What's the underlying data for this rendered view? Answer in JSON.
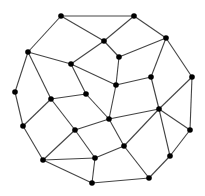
{
  "diagram": {
    "type": "undirected-graph",
    "style": {
      "background": "#ffffff",
      "node_color": "#000000",
      "edge_color": "#444444"
    },
    "nodes": [
      {
        "id": "A",
        "x": 61,
        "y": 16
      },
      {
        "id": "B",
        "x": 134,
        "y": 16
      },
      {
        "id": "C",
        "x": 104,
        "y": 41
      },
      {
        "id": "D",
        "x": 166,
        "y": 38
      },
      {
        "id": "E",
        "x": 28,
        "y": 52
      },
      {
        "id": "F",
        "x": 71,
        "y": 64
      },
      {
        "id": "G",
        "x": 119,
        "y": 57
      },
      {
        "id": "H",
        "x": 151,
        "y": 77
      },
      {
        "id": "I",
        "x": 192,
        "y": 77
      },
      {
        "id": "J",
        "x": 116,
        "y": 85
      },
      {
        "id": "K",
        "x": 15,
        "y": 92
      },
      {
        "id": "L",
        "x": 51,
        "y": 99
      },
      {
        "id": "M",
        "x": 86,
        "y": 94
      },
      {
        "id": "N",
        "x": 159,
        "y": 109
      },
      {
        "id": "O",
        "x": 109,
        "y": 119
      },
      {
        "id": "P",
        "x": 23,
        "y": 126
      },
      {
        "id": "Q",
        "x": 75,
        "y": 130
      },
      {
        "id": "R",
        "x": 190,
        "y": 130
      },
      {
        "id": "S",
        "x": 124,
        "y": 146
      },
      {
        "id": "T",
        "x": 170,
        "y": 156
      },
      {
        "id": "U",
        "x": 43,
        "y": 160
      },
      {
        "id": "V",
        "x": 95,
        "y": 158
      },
      {
        "id": "W",
        "x": 149,
        "y": 178
      },
      {
        "id": "X",
        "x": 92,
        "y": 183
      }
    ],
    "edges": [
      [
        "A",
        "B"
      ],
      [
        "A",
        "C"
      ],
      [
        "A",
        "E"
      ],
      [
        "B",
        "C"
      ],
      [
        "B",
        "D"
      ],
      [
        "C",
        "F"
      ],
      [
        "C",
        "G"
      ],
      [
        "D",
        "G"
      ],
      [
        "D",
        "H"
      ],
      [
        "D",
        "I"
      ],
      [
        "E",
        "F"
      ],
      [
        "E",
        "K"
      ],
      [
        "E",
        "L"
      ],
      [
        "F",
        "J"
      ],
      [
        "F",
        "M"
      ],
      [
        "G",
        "J"
      ],
      [
        "J",
        "H"
      ],
      [
        "J",
        "O"
      ],
      [
        "H",
        "N"
      ],
      [
        "I",
        "N"
      ],
      [
        "I",
        "R"
      ],
      [
        "K",
        "P"
      ],
      [
        "L",
        "M"
      ],
      [
        "L",
        "P"
      ],
      [
        "L",
        "Q"
      ],
      [
        "M",
        "O"
      ],
      [
        "O",
        "N"
      ],
      [
        "O",
        "S"
      ],
      [
        "O",
        "Q"
      ],
      [
        "N",
        "S"
      ],
      [
        "N",
        "T"
      ],
      [
        "N",
        "R"
      ],
      [
        "R",
        "T"
      ],
      [
        "S",
        "W"
      ],
      [
        "S",
        "V"
      ],
      [
        "T",
        "W"
      ],
      [
        "W",
        "X"
      ],
      [
        "P",
        "U"
      ],
      [
        "Q",
        "U"
      ],
      [
        "Q",
        "V"
      ],
      [
        "U",
        "V"
      ],
      [
        "U",
        "X"
      ],
      [
        "V",
        "X"
      ]
    ]
  }
}
